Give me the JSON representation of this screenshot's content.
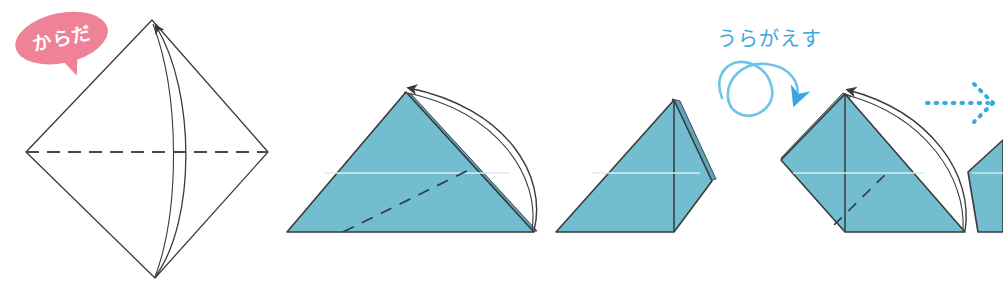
{
  "page": {
    "background_color": "#ffffff",
    "width": 1003,
    "height": 281
  },
  "palette": {
    "paper_blue": "#73bdd0",
    "paper_blue_shadow": "#5aa7bc",
    "paper_white": "#ffffff",
    "outline": "#3a3a3a",
    "crease_dash": "#4a4a4a",
    "callout_pink": "#ef8296",
    "callout_pink_soft": "#f3a3b1",
    "callout_text": "#ffffff",
    "hint_blue": "#3aa8de",
    "hint_blue_light": "#6cc5e8"
  },
  "callouts": {
    "body_label": {
      "text": "からだ",
      "shape": "speech-bubble-ellipse",
      "fill": "#ef8296",
      "text_color": "#ffffff",
      "rotation_deg": -12
    },
    "turn_over": {
      "text": "うらがえす",
      "icon": "flip-loop-arrow-icon",
      "color": "#3aa8de"
    }
  },
  "steps": [
    {
      "index": 1,
      "name": "kite-base-diamond",
      "fill": "#ffffff",
      "description": "White diamond with horizontal valley crease and curved fold arrow pointing up",
      "has_dashed_crease": true,
      "has_curved_arrow": true,
      "arrow_direction": "up"
    },
    {
      "index": 2,
      "name": "folded-triangle-left",
      "fill": "#73bdd0",
      "description": "Blue triangle, arc arrow folding top-right corner down to bottom-right corner",
      "has_dashed_crease": true,
      "has_curved_arrow": true,
      "arrow_direction": "down-right"
    },
    {
      "index": 3,
      "name": "folded-wing-shape",
      "fill": "#73bdd0",
      "description": "Blue asymmetric folded shape after the corner fold",
      "has_dashed_crease": false,
      "has_curved_arrow": false
    },
    {
      "index": 4,
      "name": "flipped-wing-shape",
      "fill": "#73bdd0",
      "description": "Shape flipped over, arc arrow folding the corner again",
      "has_dashed_crease": true,
      "has_curved_arrow": true,
      "arrow_direction": "down-right"
    },
    {
      "index": 5,
      "name": "next-step-partial",
      "fill": "#73bdd0",
      "description": "Partially visible next shape cropped at right edge",
      "has_dashed_crease": false,
      "has_curved_arrow": true
    }
  ],
  "connectors": [
    {
      "name": "dotted-progress-arrow",
      "style": "dotted",
      "color": "#3aa8de",
      "direction": "right"
    }
  ]
}
